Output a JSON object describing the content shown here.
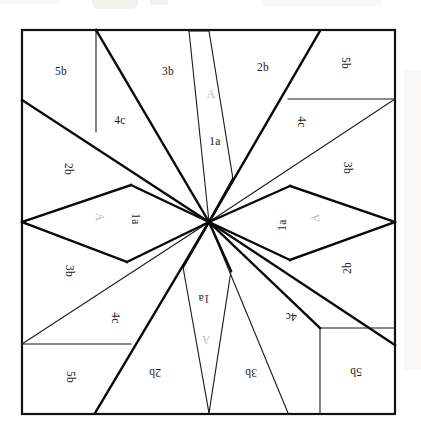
{
  "diagram": {
    "type": "quilt-block",
    "canvas": {
      "width": 421,
      "height": 436
    },
    "block": {
      "left": 22,
      "top": 30,
      "right": 395,
      "bottom": 414
    },
    "center": {
      "x": 209,
      "y": 222
    },
    "colors": {
      "outline": "#111111",
      "thin_line": "#1a1a1a",
      "thick_line": "#0a0a0a",
      "background": "#ffffff",
      "label_text": "#1a1a1a",
      "label_faint": "#b9b9b9",
      "paper": "#ebe7e2"
    },
    "line_weights": {
      "border": 2.2,
      "thick": 2.4,
      "thin": 1.1
    },
    "patch_codes": [
      "A",
      "1a",
      "2b",
      "3b",
      "4c",
      "5b"
    ],
    "pieces": [
      {
        "id": "p01",
        "label": "5b",
        "x": 61,
        "y": 72,
        "rotation": 0,
        "faint": false,
        "region": "top-left-corner-square"
      },
      {
        "id": "p02",
        "label": "3b",
        "x": 168,
        "y": 72,
        "rotation": 0,
        "faint": false,
        "region": "top-left-of-apex-triangle"
      },
      {
        "id": "p03",
        "label": "2b",
        "x": 263,
        "y": 68,
        "rotation": 0,
        "faint": false,
        "region": "top-right-triangle"
      },
      {
        "id": "p04",
        "label": "5b",
        "x": 345,
        "y": 63,
        "rotation": 270,
        "faint": false,
        "region": "right-top-corner-square"
      },
      {
        "id": "p05",
        "label": "4c",
        "x": 120,
        "y": 121,
        "rotation": 0,
        "faint": false,
        "region": "upper-left-kite"
      },
      {
        "id": "p06",
        "label": "4c",
        "x": 301,
        "y": 122,
        "rotation": 270,
        "faint": false,
        "region": "upper-right-kite"
      },
      {
        "id": "p07",
        "label": "A",
        "x": 211,
        "y": 95,
        "rotation": 0,
        "faint": true,
        "region": "north-star-point"
      },
      {
        "id": "p08",
        "label": "1a",
        "x": 215,
        "y": 142,
        "rotation": 0,
        "faint": false,
        "region": "north-star-point"
      },
      {
        "id": "p09",
        "label": "2b",
        "x": 68,
        "y": 169,
        "rotation": 270,
        "faint": false,
        "region": "left-upper-triangle"
      },
      {
        "id": "p10",
        "label": "3b",
        "x": 347,
        "y": 168,
        "rotation": 270,
        "faint": false,
        "region": "right-upper-triangle"
      },
      {
        "id": "p11",
        "label": "A",
        "x": 99,
        "y": 217,
        "rotation": 270,
        "faint": true,
        "region": "west-star-point"
      },
      {
        "id": "p12",
        "label": "1a",
        "x": 135,
        "y": 219,
        "rotation": 270,
        "faint": false,
        "region": "west-star-point"
      },
      {
        "id": "p13",
        "label": "1a",
        "x": 283,
        "y": 225,
        "rotation": 90,
        "faint": false,
        "region": "east-star-point"
      },
      {
        "id": "p14",
        "label": "A",
        "x": 316,
        "y": 218,
        "rotation": 90,
        "faint": true,
        "region": "east-star-point"
      },
      {
        "id": "p15",
        "label": "3b",
        "x": 69,
        "y": 271,
        "rotation": 270,
        "faint": false,
        "region": "left-lower-triangle"
      },
      {
        "id": "p16",
        "label": "2b",
        "x": 348,
        "y": 268,
        "rotation": 90,
        "faint": false,
        "region": "right-lower-triangle"
      },
      {
        "id": "p17",
        "label": "4c",
        "x": 115,
        "y": 318,
        "rotation": 270,
        "faint": false,
        "region": "lower-left-kite"
      },
      {
        "id": "p18",
        "label": "4c",
        "x": 291,
        "y": 316,
        "rotation": 180,
        "faint": false,
        "region": "lower-right-kite"
      },
      {
        "id": "p19",
        "label": "1a",
        "x": 204,
        "y": 298,
        "rotation": 180,
        "faint": false,
        "region": "south-star-point"
      },
      {
        "id": "p20",
        "label": "A",
        "x": 206,
        "y": 339,
        "rotation": 180,
        "faint": true,
        "region": "south-star-point"
      },
      {
        "id": "p21",
        "label": "5b",
        "x": 70,
        "y": 377,
        "rotation": 270,
        "faint": false,
        "region": "left-bottom-corner-square"
      },
      {
        "id": "p22",
        "label": "2b",
        "x": 155,
        "y": 372,
        "rotation": 180,
        "faint": false,
        "region": "bottom-left-triangle"
      },
      {
        "id": "p23",
        "label": "3b",
        "x": 251,
        "y": 372,
        "rotation": 180,
        "faint": false,
        "region": "bottom-right-triangle"
      },
      {
        "id": "p24",
        "label": "5b",
        "x": 356,
        "y": 371,
        "rotation": 180,
        "faint": false,
        "region": "bottom-right-corner-square"
      }
    ]
  }
}
